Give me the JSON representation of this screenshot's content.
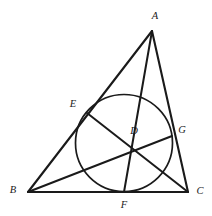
{
  "figure": {
    "kind": "euclidean-geometry-diagram",
    "background_color": "#ffffff",
    "stroke_color": "#1a1a1a"
  },
  "labels": {
    "A": "A",
    "B": "B",
    "C": "C",
    "D": "D",
    "E": "E",
    "F": "F",
    "G": "G"
  },
  "points": {
    "A": {
      "name": "A",
      "x": 152,
      "y": 31,
      "label_x": 155,
      "label_y": 17
    },
    "B": {
      "name": "B",
      "x": 28,
      "y": 192,
      "label_x": 13,
      "label_y": 191
    },
    "C": {
      "name": "C",
      "x": 188,
      "y": 192,
      "label_x": 200,
      "label_y": 192
    },
    "D": {
      "name": "D",
      "x": 124,
      "y": 143,
      "label_x": 134,
      "label_y": 132
    },
    "E": {
      "name": "E",
      "x": 87,
      "y": 113,
      "label_x": 73,
      "label_y": 105
    },
    "F": {
      "name": "F",
      "x": 124,
      "y": 192,
      "label_x": 124,
      "label_y": 206
    },
    "G": {
      "name": "G",
      "x": 172,
      "y": 136,
      "label_x": 182,
      "label_y": 131
    }
  },
  "circle": {
    "name": "incircle",
    "center_x": 124,
    "center_y": 143,
    "radius": 48.5,
    "stroke_width": 1.7
  },
  "segments": [
    {
      "name": "side-AB",
      "from": "A",
      "to": "B",
      "stroke_width": 2.1
    },
    {
      "name": "side-BC",
      "from": "B",
      "to": "C",
      "stroke_width": 2.1
    },
    {
      "name": "side-CA",
      "from": "C",
      "to": "A",
      "stroke_width": 2.1
    },
    {
      "name": "cevian-AF",
      "from": "A",
      "to": "F",
      "stroke_width": 2.0
    },
    {
      "name": "cevian-BG",
      "from": "B",
      "to": "G",
      "stroke_width": 2.0
    },
    {
      "name": "cevian-CE",
      "from": "C",
      "to": "E",
      "stroke_width": 2.0
    }
  ]
}
